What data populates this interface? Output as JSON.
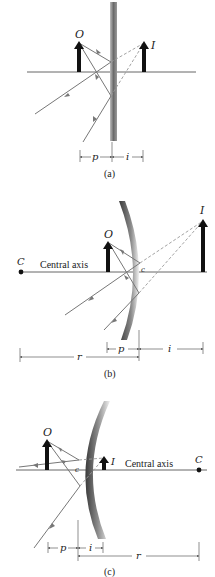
{
  "figure": {
    "panels": [
      {
        "id": "a",
        "caption": "(a)",
        "mirror_type": "plane",
        "object_label": "O",
        "image_label": "I",
        "dimensions": {
          "p": "p",
          "i": "i"
        }
      },
      {
        "id": "b",
        "caption": "(b)",
        "mirror_type": "concave",
        "object_label": "O",
        "image_label": "I",
        "center_label": "C",
        "axis_label": "Central axis",
        "vertex_label": "c",
        "dimensions": {
          "p": "p",
          "i": "i",
          "r": "r"
        }
      },
      {
        "id": "c",
        "caption": "(c)",
        "mirror_type": "convex",
        "object_label": "O",
        "image_label": "I",
        "center_label": "C",
        "axis_label": "Central axis",
        "vertex_label": "c",
        "dimensions": {
          "p": "p",
          "i": "i",
          "r": "r"
        }
      }
    ],
    "colors": {
      "arrow": "#111111",
      "ray": "#777777",
      "virtual_ray": "#999999",
      "mirror_dark": "#555555",
      "mirror_light": "#e0e0e0"
    }
  }
}
